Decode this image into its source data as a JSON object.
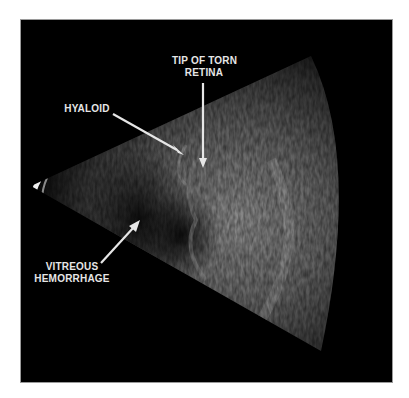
{
  "figure": {
    "labels": {
      "tip_line1": "TIP OF TORN",
      "tip_line2": "RETINA",
      "hyaloid": "HYALOID",
      "vitreous_line1": "VITREOUS",
      "vitreous_line2": "HEMORRHAGE"
    },
    "colors": {
      "background": "#000000",
      "label": "#e6e6e6",
      "page": "#ffffff"
    }
  }
}
